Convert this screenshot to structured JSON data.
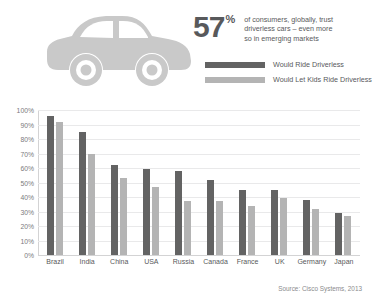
{
  "header": {
    "stat_number": "57",
    "stat_percent": "%",
    "stat_lines": [
      "of consumers, globally, trust",
      "driverless cars – even more",
      "so in emerging markets"
    ],
    "car_icon": "car-silhouette-icon"
  },
  "legend": {
    "items": [
      {
        "label": "Would Ride Driverless",
        "color": "#636363"
      },
      {
        "label": "Would Let Kids Ride Driverless",
        "color": "#b4b4b4"
      }
    ]
  },
  "source": "Source: Cisco Systems, 2013",
  "colors": {
    "dark_bar": "#636363",
    "light_bar": "#b4b4b4",
    "grid": "#e9e9ea",
    "text": "#58595b",
    "car": "#c9c9c9"
  },
  "chart_data": {
    "type": "bar",
    "title": "",
    "xlabel": "",
    "ylabel": "",
    "ylim": [
      0,
      100
    ],
    "yticks": [
      "0%",
      "10%",
      "20%",
      "30%",
      "40%",
      "50%",
      "60%",
      "70%",
      "80%",
      "90%",
      "100%"
    ],
    "ytick_values": [
      0,
      10,
      20,
      30,
      40,
      50,
      60,
      70,
      80,
      90,
      100
    ],
    "grid": true,
    "legend_position": "top-right",
    "categories": [
      "Brazil",
      "India",
      "China",
      "USA",
      "Russia",
      "Canada",
      "France",
      "UK",
      "Germany",
      "Japan"
    ],
    "series": [
      {
        "name": "Would Ride Driverless",
        "color": "#636363",
        "values": [
          96,
          85,
          62,
          59,
          58,
          52,
          45,
          45,
          38,
          29
        ]
      },
      {
        "name": "Would Let Kids Ride Driverless",
        "color": "#b4b4b4",
        "values": [
          92,
          70,
          53,
          47,
          37,
          37,
          34,
          39,
          32,
          27
        ]
      }
    ]
  }
}
